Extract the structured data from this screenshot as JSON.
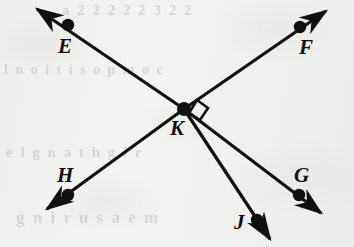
{
  "figure": {
    "background_color": "#f3f3f2",
    "ink_color": "#101010",
    "width": 354,
    "height": 247
  },
  "geometry": {
    "intersection": {
      "name": "K",
      "x": 184,
      "y": 109
    },
    "points": [
      {
        "name": "E",
        "x": 68,
        "y": 25
      },
      {
        "name": "F",
        "x": 300,
        "y": 27
      },
      {
        "name": "G",
        "x": 299,
        "y": 195
      },
      {
        "name": "H",
        "x": 68,
        "y": 195
      },
      {
        "name": "J",
        "x": 257,
        "y": 220
      },
      {
        "name": "K",
        "x": 184,
        "y": 109
      }
    ],
    "lines": [
      {
        "name": "line-EG",
        "through": "E-K-G",
        "double_arrow": true
      },
      {
        "name": "line-HF",
        "through": "H-K-F",
        "double_arrow": true
      },
      {
        "name": "ray-KJ",
        "through": "K-J",
        "double_arrow": false
      }
    ],
    "right_angle": {
      "at": "K",
      "between": "ray KF and ray KJ",
      "marker": "square"
    }
  },
  "labels": {
    "E": {
      "text": "E",
      "x": 58,
      "y": 36
    },
    "F": {
      "text": "F",
      "x": 299,
      "y": 37
    },
    "H": {
      "text": "H",
      "x": 57,
      "y": 165
    },
    "G": {
      "text": "G",
      "x": 294,
      "y": 165
    },
    "K": {
      "text": "K",
      "x": 170,
      "y": 118
    },
    "J": {
      "text": "J",
      "x": 234,
      "y": 212
    }
  },
  "ghost_text": {
    "top": "a 2 2 2 2 2 3 2 2",
    "middle": "l n o i t i s o p m o c",
    "low": "e l g n a t h g i r",
    "bottom": "g n i r u s a e m"
  }
}
